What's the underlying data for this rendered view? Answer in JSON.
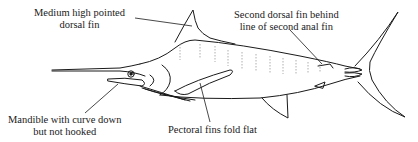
{
  "diagram": {
    "labels": {
      "dorsal": {
        "line1": "Medium high pointed",
        "line2": "dorsal fin"
      },
      "second_dorsal": {
        "line1": "Second dorsal fin behind",
        "line2": "line of second anal fin"
      },
      "mandible": {
        "line1": "Mandible with curve down",
        "line2": "but not hooked"
      },
      "pectoral": {
        "line1": "Pectoral fins fold flat"
      }
    },
    "colors": {
      "line": "#1a1a1a",
      "background": "#ffffff",
      "stripes": "#9a9a9a"
    }
  }
}
